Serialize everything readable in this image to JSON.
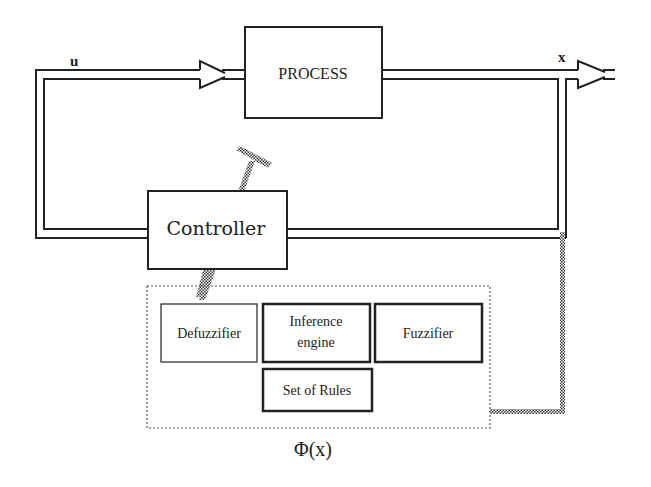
{
  "diagram": {
    "signals": {
      "input_label": "u",
      "output_label": "x"
    },
    "blocks": {
      "process": "PROCESS",
      "controller": "Controller"
    },
    "fuzzy_system": {
      "defuzzifier": "Defuzzifier",
      "inference_line1": "Inference",
      "inference_line2": "engine",
      "fuzzifier": "Fuzzifier",
      "rules": "Set of Rules",
      "caption": "Φ(x)"
    },
    "colors": {
      "stroke": "#222222",
      "background": "#ffffff",
      "dotted_border": "#555555"
    }
  }
}
